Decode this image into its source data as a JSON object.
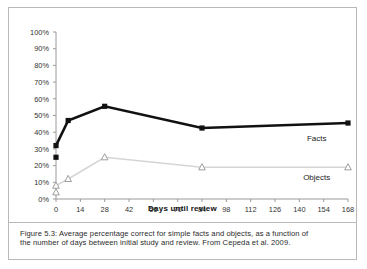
{
  "figure": {
    "caption_line1": "Figure 5.3: Average percentage correct for simple facts and objects, as a function of",
    "caption_line2": "the number of days between initial study and review. From Cepeda et al. 2009."
  },
  "colors": {
    "facts": "#111111",
    "objects": "#d5d5d5",
    "axis": "#9a9a9a",
    "frame": "#b9b9b9"
  },
  "chart_data": {
    "type": "line",
    "title": "",
    "xlabel": "Days until review",
    "ylabel": "",
    "xlim": [
      0,
      168
    ],
    "ylim": [
      0,
      1.0
    ],
    "grid": false,
    "legend": "inline-right-labels",
    "x_ticks": [
      0,
      14,
      28,
      42,
      56,
      70,
      84,
      98,
      112,
      126,
      140,
      154,
      168
    ],
    "x_tick_labels": [
      "0",
      "14",
      "28",
      "42",
      "56",
      "70",
      "84",
      "98",
      "112",
      "126",
      "140",
      "154",
      "168"
    ],
    "y_ticks": [
      0,
      0.1,
      0.2,
      0.3,
      0.4,
      0.5,
      0.6,
      0.7,
      0.8,
      0.9,
      1.0
    ],
    "y_tick_labels": [
      "0%",
      "10%",
      "20%",
      "30%",
      "40%",
      "50%",
      "60%",
      "70%",
      "80%",
      "90%",
      "100%"
    ],
    "series": [
      {
        "name": "Facts",
        "label": "Facts",
        "marker": "filled-square",
        "color": "#111111",
        "x": [
          0,
          0,
          7,
          28,
          84,
          168
        ],
        "values": [
          0.25,
          0.32,
          0.47,
          0.555,
          0.425,
          0.455
        ],
        "label_x": 150,
        "label_y": 0.345
      },
      {
        "name": "Objects",
        "label": "Objects",
        "marker": "open-triangle",
        "color": "#d5d5d5",
        "x": [
          0,
          0,
          7,
          28,
          84,
          168
        ],
        "values": [
          0.04,
          0.08,
          0.12,
          0.25,
          0.19,
          0.19
        ],
        "label_x": 150,
        "label_y": 0.115
      }
    ]
  }
}
